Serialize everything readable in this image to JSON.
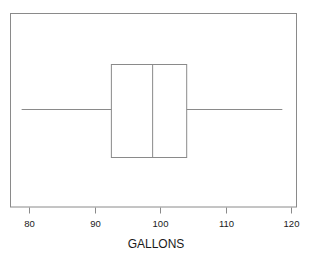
{
  "chart_data": {
    "type": "box",
    "title": "",
    "subtitle": "",
    "xlabel": "GALLONS",
    "ylabel": "",
    "orientation": "horizontal",
    "xlim": [
      77.5,
      121.5
    ],
    "grid": false,
    "legend": null,
    "tick_labels": [
      "80",
      "90",
      "100",
      "110",
      "120"
    ],
    "tick_values": [
      80,
      90,
      100,
      110,
      120
    ],
    "series": [
      {
        "name": "GALLONS",
        "min": 78.8,
        "q1": 92.5,
        "median": 98.8,
        "q3": 104.0,
        "max": 118.6,
        "outliers": []
      }
    ],
    "colors": {
      "line": "#8a8a8a",
      "box_fill": "#ffffff",
      "frame": "#8a8a8a",
      "text": "#1a1a1a",
      "background": "#ffffff"
    }
  },
  "axis": {
    "title": "GALLONS",
    "ticks": [
      {
        "label": "80",
        "value": 80
      },
      {
        "label": "90",
        "value": 90
      },
      {
        "label": "100",
        "value": 100
      },
      {
        "label": "110",
        "value": 110
      },
      {
        "label": "120",
        "value": 120
      }
    ]
  },
  "box_summary": {
    "minimum": "78.8",
    "first_quartile": "92.5",
    "median": "98.8",
    "third_quartile": "104.0",
    "maximum": "118.6"
  }
}
